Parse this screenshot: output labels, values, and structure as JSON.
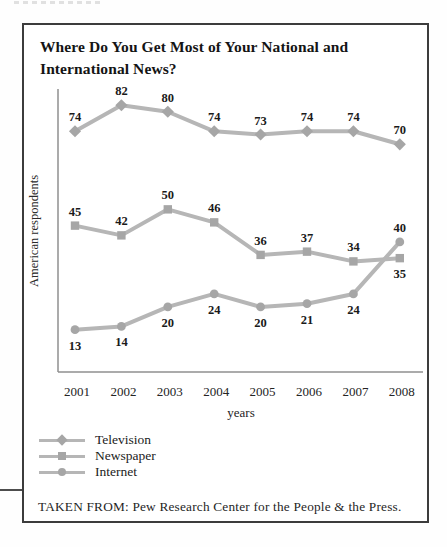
{
  "figure": {
    "caption": "TAKEN FROM: Pew Research Center for the People & the Press."
  },
  "chart_data": {
    "type": "line",
    "title": "Where Do You Get Most of Your National and International News?",
    "x": [
      "2001",
      "2002",
      "2003",
      "2004",
      "2005",
      "2006",
      "2007",
      "2008"
    ],
    "xlabel": "years",
    "ylabel": "American respondents",
    "ylim": [
      0,
      87
    ],
    "grid": false,
    "legend_position": "bottom-left",
    "line_color": "#b6b6b6",
    "marker_color": "#a6a6a6",
    "series": [
      {
        "name": "Television",
        "marker": "diamond",
        "values": [
          74,
          82,
          80,
          74,
          73,
          74,
          74,
          70
        ],
        "label_pos": [
          "above",
          "above",
          "above",
          "above",
          "above",
          "above",
          "above",
          "above"
        ]
      },
      {
        "name": "Newspaper",
        "marker": "square",
        "values": [
          45,
          42,
          50,
          46,
          36,
          37,
          34,
          35
        ],
        "label_pos": [
          "above",
          "above",
          "above",
          "above",
          "above",
          "above",
          "above",
          "below"
        ]
      },
      {
        "name": "Internet",
        "marker": "circle",
        "values": [
          13,
          14,
          20,
          24,
          20,
          21,
          24,
          40
        ],
        "label_pos": [
          "below",
          "below",
          "below",
          "below",
          "below",
          "below",
          "below",
          "above"
        ]
      }
    ]
  }
}
